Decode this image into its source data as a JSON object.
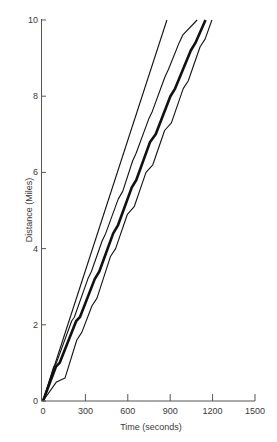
{
  "chart_data": {
    "type": "line",
    "title": "",
    "xlabel": "Time (seconds)",
    "ylabel": "Distance (Miles)",
    "xlim": [
      0,
      1500
    ],
    "ylim": [
      0,
      10
    ],
    "x_ticks": [
      0,
      300,
      600,
      900,
      1200,
      1500
    ],
    "y_ticks": [
      0,
      2,
      4,
      6,
      8,
      10
    ],
    "grid": false,
    "legend": null,
    "series": [
      {
        "name": "straight line (constant speed)",
        "style": "thin",
        "points": [
          [
            0,
            0
          ],
          [
            877,
            10
          ]
        ]
      },
      {
        "name": "stepped trajectory A",
        "style": "thin",
        "points": [
          [
            0,
            0
          ],
          [
            60,
            0.9
          ],
          [
            75,
            1.0
          ],
          [
            160,
            2.1
          ],
          [
            175,
            2.2
          ],
          [
            250,
            3.2
          ],
          [
            270,
            3.4
          ],
          [
            330,
            4.2
          ],
          [
            350,
            4.4
          ],
          [
            420,
            5.3
          ],
          [
            445,
            5.5
          ],
          [
            500,
            6.3
          ],
          [
            520,
            6.5
          ],
          [
            590,
            7.4
          ],
          [
            610,
            7.6
          ],
          [
            680,
            8.5
          ],
          [
            700,
            8.7
          ],
          [
            760,
            9.4
          ],
          [
            780,
            9.6
          ],
          [
            860,
            10.0
          ]
        ]
      },
      {
        "name": "stepped trajectory B (thick)",
        "style": "thick",
        "points": [
          [
            0,
            0
          ],
          [
            70,
            0.9
          ],
          [
            90,
            1.0
          ],
          [
            180,
            2.1
          ],
          [
            200,
            2.2
          ],
          [
            280,
            3.2
          ],
          [
            305,
            3.4
          ],
          [
            380,
            4.4
          ],
          [
            405,
            4.6
          ],
          [
            480,
            5.6
          ],
          [
            505,
            5.8
          ],
          [
            580,
            6.8
          ],
          [
            610,
            7.0
          ],
          [
            690,
            8.0
          ],
          [
            715,
            8.2
          ],
          [
            800,
            9.2
          ],
          [
            825,
            9.4
          ],
          [
            880,
            10.0
          ]
        ]
      },
      {
        "name": "stepped trajectory C",
        "style": "thin",
        "points": [
          [
            0,
            0
          ],
          [
            80,
            0.5
          ],
          [
            130,
            0.6
          ],
          [
            200,
            1.6
          ],
          [
            230,
            1.8
          ],
          [
            290,
            2.5
          ],
          [
            320,
            2.7
          ],
          [
            400,
            3.8
          ],
          [
            430,
            4.0
          ],
          [
            500,
            4.9
          ],
          [
            540,
            5.1
          ],
          [
            610,
            6.0
          ],
          [
            650,
            6.2
          ],
          [
            720,
            7.1
          ],
          [
            760,
            7.3
          ],
          [
            830,
            8.2
          ],
          [
            860,
            8.4
          ],
          [
            930,
            9.3
          ],
          [
            960,
            9.5
          ],
          [
            1000,
            10.0
          ]
        ]
      }
    ],
    "approx_end_times_at_10_miles": [
      877,
      1090,
      1150,
      1195
    ]
  }
}
